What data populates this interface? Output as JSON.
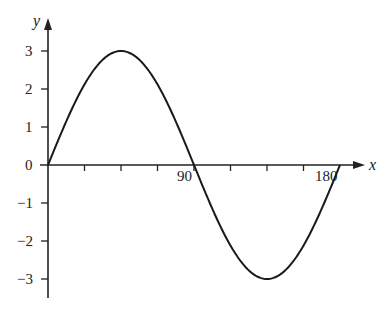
{
  "chart_data": {
    "type": "line",
    "title": "",
    "xlabel": "x",
    "ylabel": "y",
    "x_ticks": [
      0,
      22.5,
      45,
      67.5,
      90,
      112.5,
      135,
      157.5,
      180
    ],
    "x_tick_labels": {
      "90": "90",
      "180": "180"
    },
    "y_ticks": [
      -3,
      -2,
      -1,
      0,
      1,
      2,
      3
    ],
    "y_tick_labels": [
      "-3",
      "-2",
      "-1",
      "0",
      "1",
      "2",
      "3"
    ],
    "xlim": [
      0,
      180
    ],
    "ylim": [
      -3,
      3
    ],
    "grid": false,
    "series": [
      {
        "name": "y = 3 sin(2x)",
        "x": [
          0,
          15,
          30,
          45,
          60,
          75,
          90,
          105,
          120,
          135,
          150,
          165,
          180
        ],
        "y": [
          0,
          1.5,
          2.6,
          3,
          2.6,
          1.5,
          0,
          -1.5,
          -2.6,
          -3,
          -2.6,
          -1.5,
          0
        ]
      }
    ]
  },
  "labels": {
    "x_axis": "x",
    "y_axis": "y",
    "origin": "0",
    "x90": "90",
    "x180": "180",
    "y3": "3",
    "y2": "2",
    "y1": "1",
    "ym1": "−1",
    "ym2": "−2",
    "ym3": "−3"
  }
}
